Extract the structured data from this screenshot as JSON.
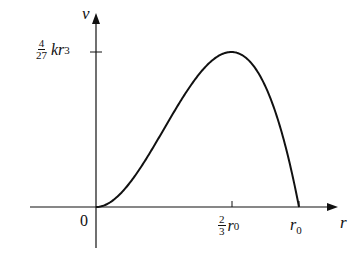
{
  "chart_data": {
    "type": "line",
    "title": "",
    "xlabel": "r",
    "ylabel": "v",
    "function": "v = k r^2 (r0 - r)",
    "x_ticks": [
      {
        "value": 0,
        "label": "0"
      },
      {
        "value": 0.6667,
        "label_num": "2",
        "label_den": "3",
        "label_var": "r",
        "label_sub": "0"
      },
      {
        "value": 1,
        "label_var": "r",
        "label_sub": "0"
      }
    ],
    "y_ticks": [
      {
        "value": 0.1481,
        "label_num": "4",
        "label_den": "27",
        "label_var": "kr",
        "label_sup": "3"
      }
    ],
    "x_normalized": [
      0,
      0.1,
      0.2,
      0.3,
      0.4,
      0.5,
      0.6,
      0.6667,
      0.7,
      0.8,
      0.9,
      1.0
    ],
    "y_normalized": [
      0,
      0.009,
      0.032,
      0.063,
      0.096,
      0.125,
      0.144,
      0.148,
      0.147,
      0.128,
      0.081,
      0
    ],
    "peak": {
      "x_label": "2/3 r0",
      "y_label": "4/27 k r^3"
    },
    "grid": false,
    "legend": "none"
  },
  "labels": {
    "v_axis": "v",
    "r_axis": "r",
    "origin": "0",
    "ymax_num": "4",
    "ymax_den": "27",
    "ymax_var": "kr",
    "ymax_sup": "3",
    "xpeak_num": "2",
    "xpeak_den": "3",
    "xpeak_var": "r",
    "xpeak_sub": "0",
    "xend_var": "r",
    "xend_sub": "0"
  }
}
